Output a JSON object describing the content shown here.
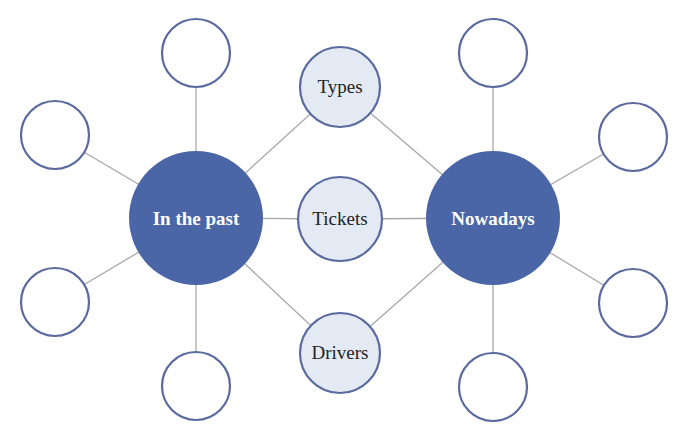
{
  "diagram": {
    "type": "double-bubble-map",
    "colors": {
      "hub_fill": "#4a66a6",
      "topic_fill": "#e4eaf4",
      "outline": "#5a6a9e",
      "connector": "#a8a8a8",
      "satellite_fill": "#ffffff"
    },
    "hubs": [
      {
        "id": "past",
        "label": "In the past",
        "cx": 196,
        "cy": 218,
        "r": 67
      },
      {
        "id": "now",
        "label": "Nowadays",
        "cx": 493,
        "cy": 218,
        "r": 67
      }
    ],
    "topics": [
      {
        "id": "types",
        "label": "Types",
        "cx": 340,
        "cy": 87,
        "r": 40
      },
      {
        "id": "tickets",
        "label": "Tickets",
        "cx": 340,
        "cy": 219,
        "r": 42
      },
      {
        "id": "drivers",
        "label": "Drivers",
        "cx": 340,
        "cy": 353,
        "r": 40
      }
    ],
    "satellites": [
      {
        "hub": "past",
        "position": "top",
        "cx": 196,
        "cy": 53,
        "r": 34,
        "label": ""
      },
      {
        "hub": "past",
        "position": "upper-left",
        "cx": 55,
        "cy": 135,
        "r": 34,
        "label": ""
      },
      {
        "hub": "past",
        "position": "lower-left",
        "cx": 55,
        "cy": 302,
        "r": 34,
        "label": ""
      },
      {
        "hub": "past",
        "position": "bottom",
        "cx": 196,
        "cy": 386,
        "r": 34,
        "label": ""
      },
      {
        "hub": "now",
        "position": "top",
        "cx": 493,
        "cy": 53,
        "r": 34,
        "label": ""
      },
      {
        "hub": "now",
        "position": "upper-right",
        "cx": 633,
        "cy": 137,
        "r": 34,
        "label": ""
      },
      {
        "hub": "now",
        "position": "lower-right",
        "cx": 633,
        "cy": 303,
        "r": 34,
        "label": ""
      },
      {
        "hub": "now",
        "position": "bottom",
        "cx": 493,
        "cy": 387,
        "r": 34,
        "label": ""
      }
    ]
  }
}
